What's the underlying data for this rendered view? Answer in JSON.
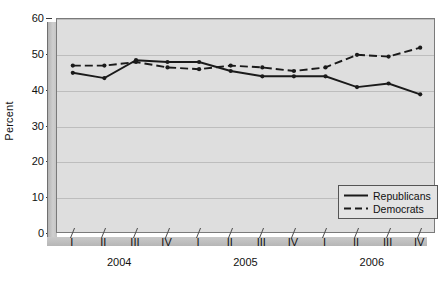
{
  "chart_data": {
    "type": "line",
    "title": "",
    "xlabel": "",
    "ylabel": "Percent",
    "ylim": [
      0,
      60
    ],
    "ytick_values": [
      0,
      10,
      20,
      30,
      40,
      50,
      60
    ],
    "grid": true,
    "legend_position": "bottom-right",
    "categories": [
      "I",
      "II",
      "III",
      "IV",
      "I",
      "II",
      "III",
      "IV",
      "I",
      "II",
      "III",
      "IV"
    ],
    "group_labels": [
      "2004",
      "2005",
      "2006"
    ],
    "series": [
      {
        "name": "Republicans",
        "style": "solid",
        "color": "#1a1a1a",
        "values": [
          45,
          43.5,
          48.5,
          48,
          48,
          45.5,
          44,
          44,
          44,
          41,
          42,
          39
        ]
      },
      {
        "name": "Democrats",
        "style": "dashed",
        "color": "#1a1a1a",
        "values": [
          47,
          47,
          48,
          46.5,
          46,
          47,
          46.5,
          45.5,
          46.5,
          50,
          49.5,
          52
        ]
      }
    ]
  },
  "legend": {
    "items": [
      {
        "label": "Republicans",
        "style": "solid"
      },
      {
        "label": "Democrats",
        "style": "dashed"
      }
    ]
  },
  "caption": ""
}
